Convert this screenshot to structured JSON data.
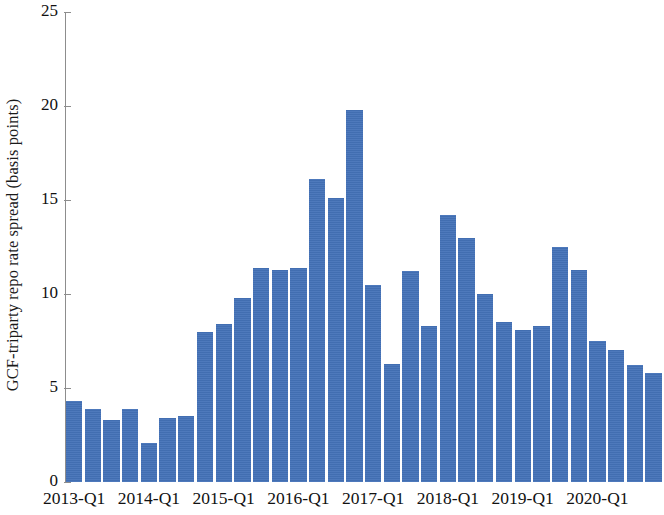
{
  "chart_data": {
    "type": "bar",
    "title": "",
    "subtitle": "",
    "xlabel": "",
    "ylabel": "GCF-triparty repo rate spread (basis points)",
    "ylim": [
      0,
      25
    ],
    "yticks": [
      0,
      5,
      10,
      15,
      20,
      25
    ],
    "ytick_labels": [
      "0",
      "5",
      "10",
      "15",
      "20",
      "25"
    ],
    "grid": false,
    "legend": null,
    "bar_color": "#4472b8",
    "axis_color": "#8d8d8d",
    "categories": [
      "2013-Q1",
      "2013-Q2",
      "2013-Q3",
      "2013-Q4",
      "2014-Q1",
      "2014-Q2",
      "2014-Q3",
      "2014-Q4",
      "2015-Q1",
      "2015-Q2",
      "2015-Q3",
      "2015-Q4",
      "2016-Q1",
      "2016-Q2",
      "2016-Q3",
      "2016-Q4",
      "2017-Q1",
      "2017-Q2",
      "2017-Q3",
      "2017-Q4",
      "2018-Q1",
      "2018-Q2",
      "2018-Q3",
      "2018-Q4",
      "2019-Q1",
      "2019-Q2",
      "2019-Q3",
      "2019-Q4",
      "2020-Q1",
      "2020-Q2",
      "2020-Q3",
      "2020-Q4"
    ],
    "values": [
      4.3,
      3.9,
      3.3,
      3.9,
      2.1,
      3.4,
      3.5,
      8.0,
      8.4,
      9.8,
      11.4,
      11.3,
      11.4,
      16.1,
      15.1,
      19.8,
      10.5,
      6.3,
      11.2,
      8.3,
      14.2,
      13.0,
      10.0,
      8.5,
      8.1,
      8.3,
      12.5,
      11.3,
      7.5,
      7.0,
      6.2,
      5.8
    ],
    "xtick_labels": [
      "2013-Q1",
      "2014-Q1",
      "2015-Q1",
      "2016-Q1",
      "2017-Q1",
      "2018-Q1",
      "2019-Q1",
      "2020-Q1"
    ],
    "xtick_indices": [
      0,
      4,
      8,
      12,
      16,
      20,
      24,
      28
    ]
  }
}
